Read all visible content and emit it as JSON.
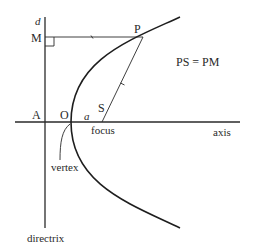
{
  "diagram": {
    "labels": {
      "directrix_symbol": "d",
      "point_m": "M",
      "point_p": "P",
      "equation": "PS = PM",
      "point_a": "A",
      "point_o": "O",
      "distance_a": "a",
      "point_s": "S",
      "focus": "focus",
      "axis": "axis",
      "vertex": "vertex",
      "directrix": "directrix"
    },
    "colors": {
      "line": "#2a2a2a",
      "curve": "#1e1e1e",
      "background": "#ffffff"
    }
  }
}
